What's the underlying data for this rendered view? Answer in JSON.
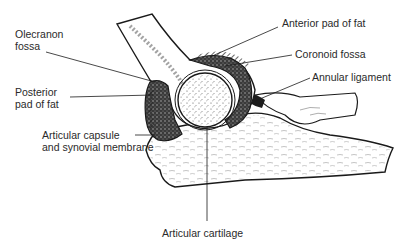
{
  "diagram": {
    "line_color": "#1a1a1a",
    "text_color": "#2a2a2a",
    "background": "#ffffff"
  },
  "labels": {
    "olecranon_fossa": {
      "line1": "Olecranon",
      "line2": "fossa"
    },
    "posterior_pad": {
      "line1": "Posterior",
      "line2": "pad of fat"
    },
    "articular_capsule": {
      "line1": "Articular capsule",
      "line2": "and synovial membrane"
    },
    "anterior_pad": {
      "line1": "Anterior pad of fat"
    },
    "coronoid_fossa": {
      "line1": "Coronoid fossa"
    },
    "annular_ligament": {
      "line1": "Annular ligament"
    },
    "articular_cartilage": {
      "line1": "Articular cartilage"
    }
  }
}
